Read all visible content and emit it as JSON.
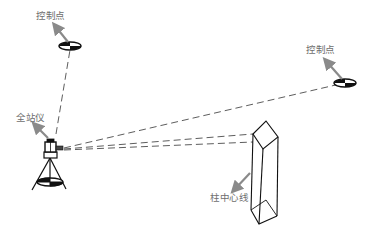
{
  "labels": {
    "control_point_left": "控制点",
    "control_point_right": "控制点",
    "total_station": "全站仪",
    "column_centerline": "柱中心线"
  },
  "colors": {
    "line": "#1a1a1a",
    "arrow": "#8a8a8a",
    "label": "#6e6e6e",
    "background": "#ffffff"
  }
}
